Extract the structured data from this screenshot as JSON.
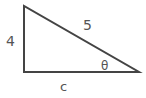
{
  "diagram": {
    "type": "right-triangle",
    "stroke_color": "#444444",
    "label_color": "#555555",
    "vertices": {
      "top": [
        24,
        6
      ],
      "right_angle": [
        24,
        72
      ],
      "acute": [
        139,
        72
      ]
    },
    "labels": {
      "vertical_side": "4",
      "hypotenuse": "5",
      "base": "c",
      "angle": "θ"
    }
  }
}
